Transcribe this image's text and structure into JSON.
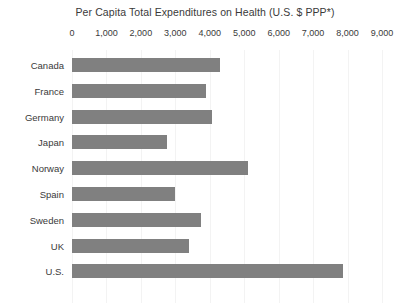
{
  "chart_data": {
    "type": "bar",
    "orientation": "horizontal",
    "title": "Per Capita Total Expenditures on Health (U.S. $ PPP*)",
    "xlabel": "",
    "ylabel": "",
    "xlim": [
      0,
      9000
    ],
    "xticks": [
      0,
      1000,
      2000,
      3000,
      4000,
      5000,
      6000,
      7000,
      8000,
      9000
    ],
    "xtick_labels": [
      "0",
      "1,000",
      "2,000",
      "3,000",
      "4,000",
      "5,000",
      "6,000",
      "7,000",
      "8,000",
      "9,000"
    ],
    "grid": true,
    "grid_axis": "x",
    "legend": false,
    "bar_color": "#808080",
    "categories": [
      "Canada",
      "France",
      "Germany",
      "Japan",
      "Norway",
      "Spain",
      "Sweden",
      "UK",
      "U.S."
    ],
    "values": [
      4300,
      3900,
      4050,
      2750,
      5100,
      3000,
      3750,
      3400,
      7880
    ]
  },
  "footnote": "",
  "colors": {
    "bar": "#808080",
    "grid": "#f3f3f3",
    "text": "#3a3a3a",
    "background": "#ffffff"
  }
}
